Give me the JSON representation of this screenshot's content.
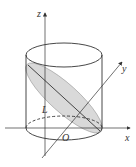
{
  "figure": {
    "type": "3d-geometry-diagram",
    "labels": {
      "z_axis": "z",
      "y_axis": "y",
      "x_axis": "x",
      "origin": "O",
      "line": "L"
    },
    "colors": {
      "stroke": "#333333",
      "section_fill": "#d9d9d9",
      "background": "#ffffff"
    }
  }
}
